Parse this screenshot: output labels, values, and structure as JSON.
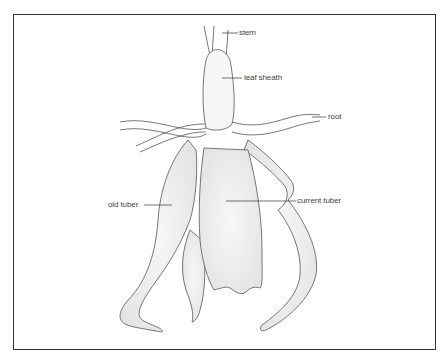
{
  "diagram": {
    "labels": {
      "stem": "stem",
      "leaf_sheath": "leaf sheath",
      "root": "root",
      "old_tuber": "old tuber",
      "current_tuber": "current tuber"
    },
    "colors": {
      "line": "#555555",
      "fill": "#f3f3f3",
      "frame": "#333333",
      "text": "#444444"
    }
  }
}
